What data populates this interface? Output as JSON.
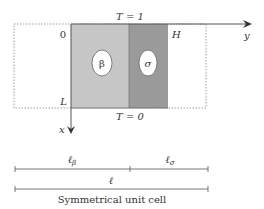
{
  "diagram": {
    "top_boundary_label": "T = 1",
    "bottom_boundary_label": "T = 0",
    "origin_label": "0",
    "length_label": "L",
    "height_label": "H",
    "y_axis_label": "y",
    "x_axis_label": "x",
    "phase_beta": "β",
    "phase_sigma": "σ",
    "dim_beta": "ℓβ",
    "dim_sigma": "ℓσ",
    "dim_beta_main": "ℓ",
    "dim_beta_sub": "β",
    "dim_sigma_main": "ℓ",
    "dim_sigma_sub": "σ",
    "dim_total": "ℓ",
    "caption": "Symmetrical unit cell",
    "colors": {
      "beta_region": "#c6c6c6",
      "sigma_region": "#9a9a9a",
      "lines": "#555555",
      "dashed": "#999999"
    }
  }
}
